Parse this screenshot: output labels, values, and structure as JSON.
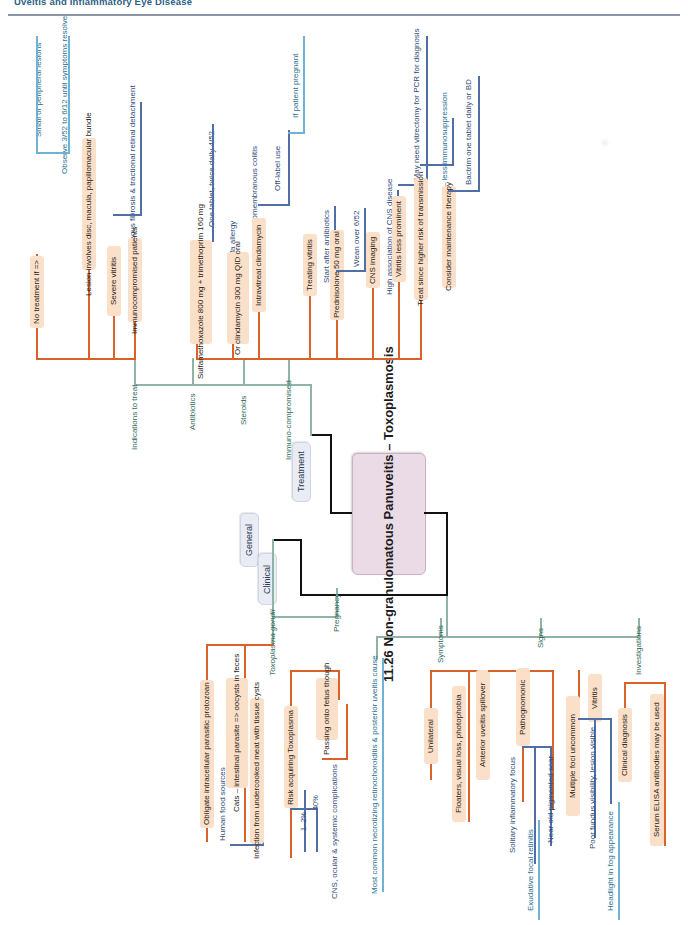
{
  "header": {
    "running_title": "Uveitis and Inflammatory Eye Disease"
  },
  "central": {
    "label": "11.26 Non-granulomatous Panuveitis – Toxoplasmosis"
  },
  "branches": {
    "treatment": {
      "label": "Treatment"
    },
    "general": {
      "label": "General"
    },
    "clinical": {
      "label": "Clinical"
    }
  },
  "treatment": {
    "groups": [
      {
        "label": "Indications to treat"
      },
      {
        "label": "Antibiotics"
      },
      {
        "label": "Steroids"
      },
      {
        "label": "Immuno-compromised"
      }
    ],
    "indications": [
      {
        "label": "No treatment if =>"
      },
      {
        "label": "Small or peripheral lesions"
      },
      {
        "label": "Observe 3/52 to 6/12 until symptoms resolve"
      },
      {
        "label": "Lesion involves disc, macula, papillomacular bundle"
      },
      {
        "label": "Severe vitritis"
      },
      {
        "label": "Risk vitreous fibrosis & tractional retinal detachment"
      },
      {
        "label": "Immunocompromised patients"
      }
    ],
    "antibiotics": [
      {
        "label": "Sulfamethoxazole 800 mg + trimethoprim 160 mg"
      },
      {
        "label": "One tablet, twice daily 4/52"
      },
      {
        "label": "If sulfa allergy"
      },
      {
        "label": "Or clindamycin 300 mg QID oral"
      },
      {
        "label": "Risk pseudomembranous colitis"
      },
      {
        "label": "Intravitreal clindamycin"
      },
      {
        "label": "Off-label use"
      },
      {
        "label": "If patient pregnant"
      }
    ],
    "steroids": [
      {
        "label": "Treating vitritis"
      },
      {
        "label": "Start after antibiotics"
      },
      {
        "label": "Prednisolone 50 mg oral"
      },
      {
        "label": "Wean over 6/52"
      }
    ],
    "immunocompromised": [
      {
        "label": "CNS imaging"
      },
      {
        "label": "High association of CNS disease"
      },
      {
        "label": "Vitritis less prominent"
      },
      {
        "label": "=> May need vitrectomy for PCR for diagnosis"
      },
      {
        "label": "Treat since higher risk of transmission"
      },
      {
        "label": "Atovaquone – less immunosuppression"
      },
      {
        "label": "Consider maintenance therapy"
      },
      {
        "label": "Bactrim one tablet daily or BD"
      }
    ]
  },
  "general": {
    "groups": [
      {
        "label": "Toxoplasma gondii"
      },
      {
        "label": "Pregnancy"
      }
    ],
    "gondii": [
      {
        "label": "Obligate intracellular parasitic protozoan"
      },
      {
        "label": "Human food sources"
      },
      {
        "label": "Cats – intestinal parasite => oocysts in feces"
      },
      {
        "label": "Infection from undercooked meat with tissue cysts"
      }
    ],
    "pregnancy": [
      {
        "label": "Risk acquiring Toxoplasma"
      },
      {
        "label": "1–2%"
      },
      {
        "label": "40%"
      },
      {
        "label": "Passing onto fetus though"
      },
      {
        "label": "CNS, ocular & systemic complications"
      }
    ]
  },
  "clinical": {
    "groups": [
      {
        "label": "Symptoms"
      },
      {
        "label": "Signs"
      },
      {
        "label": "Investigations"
      }
    ],
    "intro": {
      "label": "Most common necrotizing retinochoroiditis & posterior uveitis cause"
    },
    "symptoms": [
      {
        "label": "Unilateral"
      },
      {
        "label": "Floaters, visual loss, photophobia"
      },
      {
        "label": "Anterior uveitis spillover"
      }
    ],
    "signs": [
      {
        "label": "Pathognomonic"
      },
      {
        "label": "Solitary inflammatory focus"
      },
      {
        "label": "Exudative focal retinitis"
      },
      {
        "label": "Near old pigmented scar"
      },
      {
        "label": "Multiple foci uncommon"
      },
      {
        "label": "Vitritis"
      },
      {
        "label": "Poor fundus visibility, lesion visible"
      },
      {
        "label": "Headlight in fog appearance"
      }
    ],
    "investigations": [
      {
        "label": "Clinical diagnosis"
      },
      {
        "label": "Serum ELISA antibodies may be used"
      }
    ]
  },
  "palette": {
    "central_fill": "#eadbe6",
    "branch_fill": "#e9ecf5",
    "leaf_fill": "#fae0c8",
    "green": "#8fb3a4",
    "orange": "#d9622a",
    "blue": "#4f6fa6",
    "light_blue": "#6fb2d6"
  }
}
